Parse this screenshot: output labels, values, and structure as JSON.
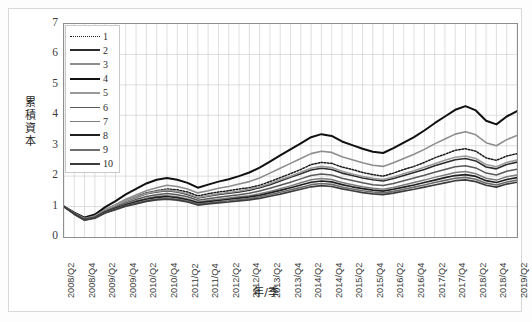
{
  "chart_data": {
    "type": "line",
    "title": "",
    "xlabel": "年/季",
    "ylabel": "累積資本",
    "ylim": [
      0,
      7
    ],
    "yticks": [
      0,
      1,
      2,
      3,
      4,
      5,
      6,
      7
    ],
    "grid": true,
    "legend_position": "top-left inside plot",
    "categories": [
      "2008/Q2",
      "2008/Q3",
      "2008/Q4",
      "2009/Q1",
      "2009/Q2",
      "2009/Q3",
      "2009/Q4",
      "2010/Q1",
      "2010/Q2",
      "2010/Q3",
      "2010/Q4",
      "2011/Q1",
      "2011/Q2",
      "2011/Q3",
      "2011/Q4",
      "2012/Q1",
      "2012/Q2",
      "2012/Q3",
      "2012/Q4",
      "2013/Q1",
      "2013/Q2",
      "2013/Q3",
      "2013/Q4",
      "2014/Q1",
      "2014/Q2",
      "2014/Q3",
      "2014/Q4",
      "2015/Q1",
      "2015/Q2",
      "2015/Q3",
      "2015/Q4",
      "2016/Q1",
      "2016/Q2",
      "2016/Q3",
      "2016/Q4",
      "2017/Q1",
      "2017/Q2",
      "2017/Q3",
      "2017/Q4",
      "2018/Q1",
      "2018/Q2",
      "2018/Q3",
      "2018/Q4",
      "2019/Q1",
      "2019/Q2"
    ],
    "tick_labels": [
      "2008/Q2",
      "2008/Q4",
      "2009/Q2",
      "2009/Q4",
      "2010/Q2",
      "2010/Q4",
      "2011/Q2",
      "2011/Q4",
      "2012/Q2",
      "2012/Q4",
      "2013/Q2",
      "2013/Q4",
      "2014/Q2",
      "2014/Q4",
      "2015/Q2",
      "2015/Q4",
      "2016/Q2",
      "2016/Q4",
      "2017/Q2",
      "2017/Q4",
      "2018/Q2",
      "2018/Q4",
      "2019/Q2"
    ],
    "series": [
      {
        "name": "1",
        "color": "#1a1a1a",
        "width": 1.5,
        "dash": "1.6,1.6",
        "values": [
          1.0,
          0.78,
          0.62,
          0.7,
          0.9,
          1.05,
          1.2,
          1.32,
          1.45,
          1.52,
          1.58,
          1.55,
          1.48,
          1.35,
          1.42,
          1.48,
          1.52,
          1.58,
          1.62,
          1.7,
          1.82,
          1.95,
          2.08,
          2.22,
          2.38,
          2.45,
          2.42,
          2.3,
          2.22,
          2.12,
          2.05,
          2.0,
          2.1,
          2.22,
          2.32,
          2.45,
          2.6,
          2.72,
          2.85,
          2.9,
          2.82,
          2.6,
          2.52,
          2.66,
          2.74
        ]
      },
      {
        "name": "2",
        "color": "#2c2c2c",
        "width": 1.6,
        "dash": "",
        "values": [
          1.0,
          0.78,
          0.6,
          0.68,
          0.88,
          1.02,
          1.18,
          1.3,
          1.42,
          1.48,
          1.52,
          1.48,
          1.4,
          1.28,
          1.34,
          1.4,
          1.44,
          1.48,
          1.54,
          1.62,
          1.72,
          1.84,
          1.96,
          2.08,
          2.2,
          2.26,
          2.22,
          2.1,
          2.02,
          1.94,
          1.88,
          1.84,
          1.92,
          2.02,
          2.12,
          2.22,
          2.34,
          2.44,
          2.54,
          2.58,
          2.5,
          2.3,
          2.24,
          2.38,
          2.46
        ]
      },
      {
        "name": "3",
        "color": "#8e8e8e",
        "width": 1.6,
        "dash": "",
        "values": [
          1.0,
          0.79,
          0.62,
          0.7,
          0.9,
          1.06,
          1.24,
          1.38,
          1.52,
          1.62,
          1.7,
          1.66,
          1.58,
          1.45,
          1.52,
          1.6,
          1.66,
          1.74,
          1.82,
          1.94,
          2.1,
          2.26,
          2.42,
          2.58,
          2.74,
          2.82,
          2.78,
          2.64,
          2.54,
          2.44,
          2.36,
          2.32,
          2.44,
          2.58,
          2.72,
          2.88,
          3.06,
          3.22,
          3.38,
          3.46,
          3.36,
          3.1,
          3.0,
          3.2,
          3.34
        ]
      },
      {
        "name": "4",
        "color": "#111111",
        "width": 2.0,
        "dash": "",
        "values": [
          1.0,
          0.8,
          0.64,
          0.74,
          0.98,
          1.18,
          1.4,
          1.58,
          1.76,
          1.88,
          1.94,
          1.88,
          1.78,
          1.62,
          1.72,
          1.82,
          1.9,
          2.0,
          2.12,
          2.28,
          2.48,
          2.68,
          2.88,
          3.08,
          3.28,
          3.38,
          3.32,
          3.14,
          3.02,
          2.9,
          2.8,
          2.76,
          2.92,
          3.1,
          3.28,
          3.5,
          3.74,
          3.96,
          4.18,
          4.3,
          4.16,
          3.82,
          3.7,
          3.96,
          4.14
        ]
      },
      {
        "name": "5",
        "color": "#9a9a9a",
        "width": 1.6,
        "dash": "",
        "values": [
          1.0,
          0.78,
          0.61,
          0.69,
          0.89,
          1.03,
          1.19,
          1.31,
          1.43,
          1.5,
          1.54,
          1.5,
          1.42,
          1.3,
          1.36,
          1.42,
          1.46,
          1.51,
          1.57,
          1.65,
          1.76,
          1.88,
          2.0,
          2.13,
          2.26,
          2.32,
          2.28,
          2.16,
          2.07,
          1.99,
          1.93,
          1.89,
          1.97,
          2.08,
          2.18,
          2.29,
          2.41,
          2.52,
          2.62,
          2.66,
          2.58,
          2.38,
          2.31,
          2.45,
          2.53
        ]
      },
      {
        "name": "6",
        "color": "#5a5a5a",
        "width": 1.5,
        "dash": "",
        "values": [
          1.0,
          0.77,
          0.59,
          0.66,
          0.85,
          0.98,
          1.12,
          1.23,
          1.33,
          1.39,
          1.43,
          1.39,
          1.32,
          1.21,
          1.26,
          1.31,
          1.35,
          1.39,
          1.44,
          1.51,
          1.6,
          1.7,
          1.8,
          1.91,
          2.02,
          2.07,
          2.04,
          1.93,
          1.86,
          1.78,
          1.72,
          1.69,
          1.76,
          1.85,
          1.94,
          2.03,
          2.13,
          2.22,
          2.31,
          2.34,
          2.27,
          2.1,
          2.04,
          2.16,
          2.23
        ]
      },
      {
        "name": "7",
        "color": "#7d7d7d",
        "width": 1.5,
        "dash": "",
        "values": [
          1.0,
          0.76,
          0.58,
          0.65,
          0.83,
          0.95,
          1.08,
          1.18,
          1.27,
          1.33,
          1.36,
          1.32,
          1.25,
          1.15,
          1.2,
          1.24,
          1.28,
          1.32,
          1.36,
          1.42,
          1.5,
          1.59,
          1.68,
          1.78,
          1.88,
          1.92,
          1.89,
          1.79,
          1.72,
          1.65,
          1.6,
          1.57,
          1.63,
          1.71,
          1.79,
          1.87,
          1.96,
          2.04,
          2.12,
          2.15,
          2.08,
          1.93,
          1.87,
          1.98,
          2.04
        ]
      },
      {
        "name": "8",
        "color": "#1f1f1f",
        "width": 1.7,
        "dash": "",
        "values": [
          1.0,
          0.76,
          0.57,
          0.64,
          0.82,
          0.94,
          1.06,
          1.16,
          1.24,
          1.3,
          1.33,
          1.29,
          1.22,
          1.12,
          1.16,
          1.2,
          1.24,
          1.28,
          1.32,
          1.37,
          1.45,
          1.53,
          1.62,
          1.71,
          1.8,
          1.84,
          1.81,
          1.72,
          1.65,
          1.59,
          1.54,
          1.51,
          1.57,
          1.64,
          1.71,
          1.79,
          1.87,
          1.95,
          2.02,
          2.05,
          1.99,
          1.85,
          1.79,
          1.89,
          1.95
        ]
      },
      {
        "name": "9",
        "color": "#6e6e6e",
        "width": 1.6,
        "dash": "",
        "values": [
          1.0,
          0.75,
          0.56,
          0.63,
          0.8,
          0.92,
          1.03,
          1.12,
          1.2,
          1.25,
          1.28,
          1.24,
          1.18,
          1.08,
          1.12,
          1.16,
          1.19,
          1.23,
          1.26,
          1.32,
          1.39,
          1.47,
          1.55,
          1.63,
          1.72,
          1.76,
          1.73,
          1.64,
          1.58,
          1.52,
          1.48,
          1.45,
          1.5,
          1.57,
          1.64,
          1.71,
          1.79,
          1.86,
          1.93,
          1.96,
          1.9,
          1.77,
          1.71,
          1.81,
          1.87
        ]
      },
      {
        "name": "10",
        "color": "#3d3d3d",
        "width": 1.7,
        "dash": "",
        "values": [
          1.0,
          0.75,
          0.55,
          0.62,
          0.79,
          0.9,
          1.01,
          1.09,
          1.17,
          1.22,
          1.24,
          1.21,
          1.15,
          1.05,
          1.09,
          1.12,
          1.15,
          1.19,
          1.22,
          1.27,
          1.34,
          1.41,
          1.49,
          1.57,
          1.65,
          1.69,
          1.66,
          1.58,
          1.52,
          1.46,
          1.42,
          1.39,
          1.44,
          1.51,
          1.57,
          1.64,
          1.71,
          1.78,
          1.85,
          1.88,
          1.82,
          1.7,
          1.64,
          1.74,
          1.8
        ]
      }
    ]
  }
}
